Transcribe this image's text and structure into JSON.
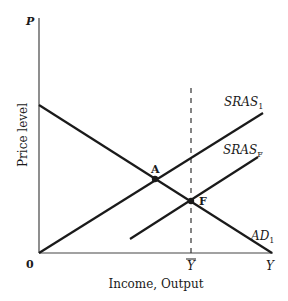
{
  "diagram": {
    "type": "aggregate-demand-aggregate-supply",
    "y_axis": {
      "symbol": "P",
      "label": "Price level"
    },
    "x_axis": {
      "symbol": "Y",
      "label": "Income, Output",
      "origin": "0",
      "tick_label": "Y",
      "tick_overline": true
    },
    "curves": [
      {
        "id": "SRAS1",
        "name": "SRAS",
        "subscript": "1",
        "x1": 39,
        "y1": 253,
        "x2": 263,
        "y2": 113
      },
      {
        "id": "SRASF",
        "name": "SRAS",
        "subscript": "F",
        "x1": 130,
        "y1": 239,
        "x2": 258,
        "y2": 157
      },
      {
        "id": "AD1",
        "name": "AD",
        "subscript": "1",
        "x1": 39,
        "y1": 105,
        "x2": 272,
        "y2": 253
      }
    ],
    "points": [
      {
        "label": "A",
        "x": 155,
        "y": 179
      },
      {
        "label": "F",
        "x": 191,
        "y": 201
      }
    ],
    "dashed_line": {
      "label": "Y-bar (potential output)",
      "x": 191,
      "y_top": 88,
      "y_bottom": 253
    },
    "colors": {
      "line": "#1a1a1a",
      "axis": "#444444",
      "background": "#ffffff"
    }
  }
}
